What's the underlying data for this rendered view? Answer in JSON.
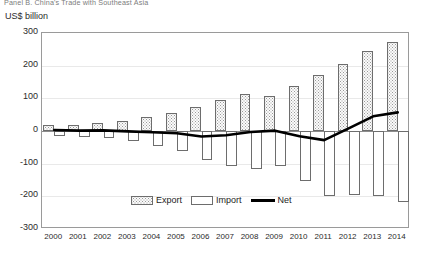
{
  "title": "Panel B. China's Trade with Southeast Asia",
  "axis_label": "US$ billion",
  "legend": {
    "export": "Export",
    "import": "Import",
    "net": "Net"
  },
  "chart_data": {
    "type": "bar",
    "title": "Panel B. China's Trade with Southeast Asia",
    "xlabel": "",
    "ylabel": "US$ billion",
    "ylim": [
      -300,
      300
    ],
    "ytick_labels": [
      "300",
      "200",
      "100",
      "0",
      "-100",
      "-200",
      "-300"
    ],
    "ytick_values": [
      300,
      200,
      100,
      0,
      -100,
      -200,
      -300
    ],
    "grid": true,
    "legend_position": "bottom-center",
    "categories": [
      "2000",
      "2001",
      "2002",
      "2003",
      "2004",
      "2005",
      "2006",
      "2007",
      "2008",
      "2009",
      "2010",
      "2011",
      "2012",
      "2013",
      "2014"
    ],
    "series": [
      {
        "name": "Export",
        "type": "bar",
        "values": [
          17,
          18,
          24,
          31,
          43,
          55,
          72,
          95,
          114,
          107,
          138,
          170,
          204,
          244,
          272
        ]
      },
      {
        "name": "Import",
        "type": "bar",
        "values": [
          -14,
          -17,
          -22,
          -32,
          -47,
          -62,
          -89,
          -108,
          -117,
          -106,
          -154,
          -198,
          -196,
          -199,
          -216
        ]
      },
      {
        "name": "Net",
        "type": "line",
        "values": [
          3,
          1,
          2,
          -1,
          -4,
          -7,
          -17,
          -13,
          -3,
          1,
          -16,
          -28,
          8,
          45,
          57
        ]
      }
    ]
  }
}
